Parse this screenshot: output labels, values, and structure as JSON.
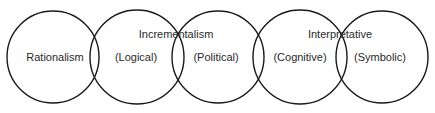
{
  "diagram": {
    "circles": [
      {
        "id": "c1",
        "cx": 53,
        "cy": 57,
        "r": 46,
        "label": "Rationalism"
      },
      {
        "id": "c2",
        "cx": 137,
        "cy": 57,
        "r": 47,
        "label": "(Logical)"
      },
      {
        "id": "c3",
        "cx": 218,
        "cy": 57,
        "r": 46,
        "label": "(Political)"
      },
      {
        "id": "c4",
        "cx": 300,
        "cy": 57,
        "r": 47,
        "label": "(Cognitive)"
      },
      {
        "id": "c5",
        "cx": 382,
        "cy": 57,
        "r": 46,
        "label": "(Symbolic)"
      }
    ],
    "group_labels": [
      {
        "id": "incrementalism",
        "label": "Incrementalism"
      },
      {
        "id": "interpretative",
        "label": "Interpretative"
      }
    ],
    "stroke_color": "#1a1a1a"
  }
}
